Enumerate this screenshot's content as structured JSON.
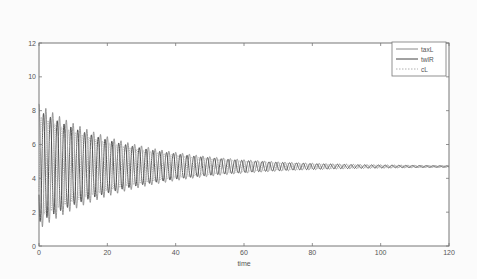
{
  "chart_data": {
    "type": "line",
    "title": "",
    "xlabel": "time",
    "ylabel": "",
    "xlim": [
      0,
      120
    ],
    "ylim": [
      0,
      12
    ],
    "xticks": [
      0,
      20,
      40,
      60,
      80,
      100,
      120
    ],
    "yticks": [
      0,
      2,
      4,
      6,
      8,
      10,
      12
    ],
    "grid": false,
    "legend_position": "upper right",
    "model": "damped oscillation converging to ~4.7",
    "series": [
      {
        "name": "taxL",
        "style": "solid",
        "color": "#8a8a8a",
        "equilibrium": 4.7,
        "initial_amplitude": 3.7,
        "decay": 0.037,
        "period": 2.0,
        "phase": 0.0
      },
      {
        "name": "twlR",
        "style": "solid",
        "color": "#444444",
        "equilibrium": 4.7,
        "initial_amplitude": 3.3,
        "decay": 0.037,
        "period": 2.0,
        "phase": 2.1
      },
      {
        "name": "cL",
        "style": "dotted",
        "color": "#b0b0b0",
        "equilibrium": 4.7,
        "initial_amplitude": 3.0,
        "decay": 0.037,
        "period": 2.0,
        "phase": 4.2
      }
    ],
    "sampled_envelope": {
      "t": [
        0,
        20,
        40,
        60,
        80,
        100,
        120
      ],
      "upper": [
        10.0,
        6.7,
        5.6,
        5.1,
        4.9,
        4.8,
        4.75
      ],
      "lower": [
        2.5,
        3.3,
        3.9,
        4.3,
        4.5,
        4.6,
        4.65
      ]
    }
  },
  "legend": {
    "items": [
      {
        "label": "taxL"
      },
      {
        "label": "twlR"
      },
      {
        "label": "cL"
      }
    ]
  }
}
